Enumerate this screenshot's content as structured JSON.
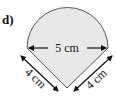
{
  "problem": {
    "label": "d)"
  },
  "figure": {
    "shape": "semicircle on top of isosceles triangle",
    "fill_color": "#e8e8e8",
    "stroke_color": "#555555",
    "dimensions": {
      "diameter": "5 cm",
      "left_side": "4 cm",
      "right_side": "4 cm"
    }
  }
}
